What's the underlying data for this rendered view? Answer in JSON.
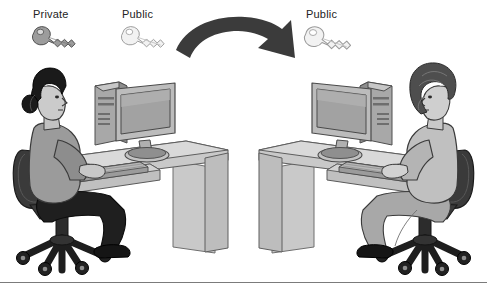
{
  "figure": {
    "title_visible": false,
    "background_color": "#ffffff",
    "width": 487,
    "height": 290,
    "baseline_rule_color": "#7b7b7b"
  },
  "labels": {
    "private_key": "Private",
    "public_key_left": "Public",
    "public_key_right": "Public"
  },
  "keys": [
    {
      "id": "private-key",
      "label": "Private",
      "fill_color": "#9a9a9a",
      "outline_color": "#555555",
      "side": "left"
    },
    {
      "id": "public-key-left",
      "label": "Public",
      "fill_color": "#f0f0f0",
      "outline_color": "#8a8a8a",
      "side": "left"
    },
    {
      "id": "public-key-right",
      "label": "Public",
      "fill_color": "#f0f0f0",
      "outline_color": "#8a8a8a",
      "side": "right"
    }
  ],
  "arrow": {
    "id": "transfer-arrow",
    "direction": "left-to-right",
    "fill_color": "#3b3b3b"
  },
  "workstations": [
    {
      "id": "left-workstation",
      "person_facing": "right",
      "hair_color": "#1c1c1c",
      "shirt_color": "#9b9b9b",
      "pants_color": "#1e1e1e",
      "chair_color": "#2a2a2a",
      "desk_color": "#c4c4c4",
      "monitor_screen_color": "#a8a8a8",
      "tower_color": "#9e9e9e"
    },
    {
      "id": "right-workstation",
      "person_facing": "left",
      "hair_color": "#4a4a4a",
      "shirt_color": "#bdbdbd",
      "pants_color": "#a5a5a5",
      "chair_color": "#2a2a2a",
      "desk_color": "#c4c4c4",
      "monitor_screen_color": "#a8a8a8",
      "tower_color": "#9e9e9e"
    }
  ]
}
